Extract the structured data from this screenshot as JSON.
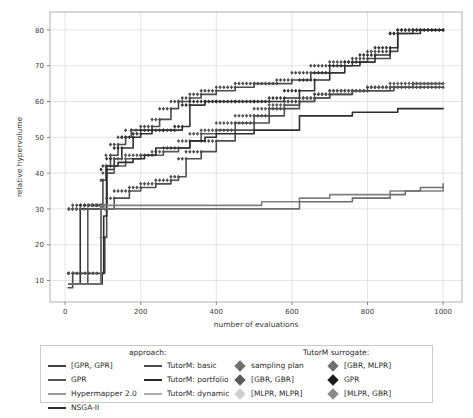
{
  "chart_data": {
    "type": "line",
    "title": "",
    "xlabel": "number of evaluations",
    "ylabel": "relative hypervolume",
    "xlim": [
      -40,
      1050
    ],
    "ylim": [
      4,
      85
    ],
    "xticks": [
      0,
      200,
      400,
      600,
      800,
      1000
    ],
    "yticks": [
      10,
      20,
      30,
      40,
      50,
      60,
      70,
      80
    ],
    "grid": true,
    "legend_position": "below-axes",
    "series": [
      {
        "name": "TutorM: basic",
        "color": "#4d4d4d",
        "marker": "diamond",
        "points": [
          [
            8,
            8
          ],
          [
            20,
            12
          ],
          [
            95,
            31
          ],
          [
            100,
            38
          ],
          [
            108,
            42
          ],
          [
            120,
            45
          ],
          [
            140,
            48
          ],
          [
            160,
            50
          ],
          [
            175,
            52
          ],
          [
            200,
            52
          ],
          [
            230,
            53
          ],
          [
            250,
            55
          ],
          [
            280,
            58
          ],
          [
            300,
            60
          ],
          [
            310,
            60
          ],
          [
            330,
            61
          ],
          [
            360,
            62
          ],
          [
            400,
            63
          ],
          [
            450,
            64
          ],
          [
            500,
            65
          ],
          [
            560,
            65
          ],
          [
            600,
            66
          ],
          [
            650,
            68
          ],
          [
            700,
            70
          ],
          [
            760,
            71
          ],
          [
            800,
            72
          ],
          [
            860,
            74
          ],
          [
            880,
            79
          ],
          [
            920,
            80
          ],
          [
            1000,
            80
          ]
        ]
      },
      {
        "name": "TutorM: portfolio",
        "color": "#333333",
        "marker": "diamond",
        "points": [
          [
            10,
            9
          ],
          [
            40,
            30
          ],
          [
            95,
            31
          ],
          [
            110,
            41
          ],
          [
            130,
            44
          ],
          [
            150,
            47
          ],
          [
            180,
            50
          ],
          [
            200,
            51
          ],
          [
            230,
            52
          ],
          [
            260,
            52
          ],
          [
            290,
            52
          ],
          [
            310,
            53
          ],
          [
            330,
            59
          ],
          [
            370,
            60
          ],
          [
            400,
            60
          ],
          [
            450,
            60
          ],
          [
            500,
            60
          ],
          [
            540,
            60
          ],
          [
            580,
            61
          ],
          [
            620,
            63
          ],
          [
            660,
            66
          ],
          [
            700,
            68
          ],
          [
            740,
            70
          ],
          [
            780,
            71
          ],
          [
            820,
            73
          ],
          [
            860,
            75
          ],
          [
            880,
            79
          ],
          [
            940,
            80
          ],
          [
            1000,
            80
          ]
        ]
      },
      {
        "name": "[GPR, GPR]",
        "color": "#595959",
        "marker": "diamond",
        "points": [
          [
            10,
            9
          ],
          [
            60,
            30
          ],
          [
            100,
            31
          ],
          [
            110,
            40
          ],
          [
            130,
            42
          ],
          [
            160,
            44
          ],
          [
            200,
            45
          ],
          [
            230,
            45
          ],
          [
            260,
            46
          ],
          [
            300,
            47
          ],
          [
            330,
            49
          ],
          [
            360,
            51
          ],
          [
            400,
            52
          ],
          [
            450,
            54
          ],
          [
            500,
            56
          ],
          [
            540,
            58
          ],
          [
            580,
            59
          ],
          [
            620,
            60
          ],
          [
            660,
            61
          ],
          [
            700,
            62
          ],
          [
            760,
            63
          ],
          [
            800,
            63
          ],
          [
            860,
            64
          ],
          [
            920,
            65
          ],
          [
            1000,
            65
          ]
        ]
      },
      {
        "name": "GPR",
        "color": "#4f4f4f",
        "marker": "diamond",
        "points": [
          [
            10,
            9
          ],
          [
            95,
            12
          ],
          [
            105,
            22
          ],
          [
            110,
            30
          ],
          [
            130,
            33
          ],
          [
            170,
            35
          ],
          [
            200,
            36
          ],
          [
            240,
            37
          ],
          [
            280,
            38
          ],
          [
            300,
            39
          ],
          [
            320,
            44
          ],
          [
            360,
            46
          ],
          [
            400,
            49
          ],
          [
            450,
            52
          ],
          [
            500,
            54
          ],
          [
            540,
            56
          ],
          [
            580,
            58
          ],
          [
            620,
            60
          ],
          [
            660,
            61
          ],
          [
            700,
            62
          ],
          [
            760,
            63
          ],
          [
            800,
            63
          ],
          [
            870,
            64
          ],
          [
            940,
            64
          ],
          [
            1000,
            64
          ]
        ]
      },
      {
        "name": "NSGA-II",
        "color": "#2e2e2e",
        "marker": "none",
        "points": [
          [
            10,
            9
          ],
          [
            98,
            12
          ],
          [
            102,
            28
          ],
          [
            110,
            42
          ],
          [
            140,
            43
          ],
          [
            180,
            44
          ],
          [
            210,
            45
          ],
          [
            240,
            47
          ],
          [
            270,
            47
          ],
          [
            300,
            47
          ],
          [
            330,
            49
          ],
          [
            370,
            50
          ],
          [
            400,
            51
          ],
          [
            450,
            51
          ],
          [
            500,
            52
          ],
          [
            560,
            52
          ],
          [
            600,
            52
          ],
          [
            620,
            56
          ],
          [
            700,
            56
          ],
          [
            760,
            57
          ],
          [
            820,
            57
          ],
          [
            880,
            58
          ],
          [
            940,
            58
          ],
          [
            1000,
            58
          ]
        ]
      },
      {
        "name": "Hypermapper 2.0",
        "color": "#808080",
        "marker": "none",
        "points": [
          [
            10,
            9
          ],
          [
            95,
            31
          ],
          [
            100,
            31
          ],
          [
            130,
            31
          ],
          [
            200,
            31
          ],
          [
            300,
            31
          ],
          [
            400,
            31
          ],
          [
            460,
            31
          ],
          [
            520,
            32
          ],
          [
            580,
            32
          ],
          [
            620,
            33
          ],
          [
            660,
            33
          ],
          [
            700,
            34
          ],
          [
            760,
            34
          ],
          [
            820,
            34
          ],
          [
            860,
            35
          ],
          [
            900,
            35
          ],
          [
            940,
            35
          ],
          [
            1000,
            36
          ]
        ]
      },
      {
        "name": "TutorM: dynamic",
        "color": "#6e6e6e",
        "marker": "none",
        "points": [
          [
            10,
            9
          ],
          [
            95,
            30
          ],
          [
            140,
            30
          ],
          [
            200,
            30
          ],
          [
            300,
            30
          ],
          [
            400,
            30
          ],
          [
            500,
            30
          ],
          [
            590,
            30
          ],
          [
            600,
            30
          ],
          [
            620,
            32
          ],
          [
            700,
            32
          ],
          [
            760,
            33
          ],
          [
            800,
            33
          ],
          [
            860,
            34
          ],
          [
            900,
            35
          ],
          [
            940,
            36
          ],
          [
            1000,
            37
          ]
        ]
      }
    ]
  },
  "axes": {
    "xlabel": "number of evaluations",
    "ylabel": "relative hypervolume",
    "xticks": [
      "0",
      "200",
      "400",
      "600",
      "800",
      "1000"
    ],
    "yticks": [
      "10",
      "20",
      "30",
      "40",
      "50",
      "60",
      "70",
      "80"
    ]
  },
  "legend": {
    "approach_title": "approach:",
    "surrogate_title": "TutorM surrogate:",
    "approach_col1": [
      {
        "label": "[GPR, GPR]",
        "color": "#3f3f3f"
      },
      {
        "label": "GPR",
        "color": "#555555"
      },
      {
        "label": "Hypermapper 2.0",
        "color": "#9a9a9a"
      },
      {
        "label": "NSGA-II",
        "color": "#2e2e2e"
      }
    ],
    "approach_col2": [
      {
        "label": "TutorM: basic",
        "color": "#4d4d4d"
      },
      {
        "label": "TutorM: portfolio",
        "color": "#262626"
      },
      {
        "label": "TutorM: dynamic",
        "color": "#adadad"
      }
    ],
    "surrogate_col1": [
      {
        "label": "sampling plan",
        "color": "#707070"
      },
      {
        "label": "[GBR, GBR]",
        "color": "#5a5a5a"
      },
      {
        "label": "[MLPR, MLPR]",
        "color": "#cfcfcf"
      }
    ],
    "surrogate_col2": [
      {
        "label": "[GBR, MLPR]",
        "color": "#707070"
      },
      {
        "label": "GPR",
        "color": "#1a1a1a"
      },
      {
        "label": "[MLPR, GBR]",
        "color": "#8a8a8a"
      }
    ]
  },
  "style": {
    "grid_color": "#d9d9d9",
    "frame_color": "#b0b0b0",
    "background": "#ffffff"
  }
}
